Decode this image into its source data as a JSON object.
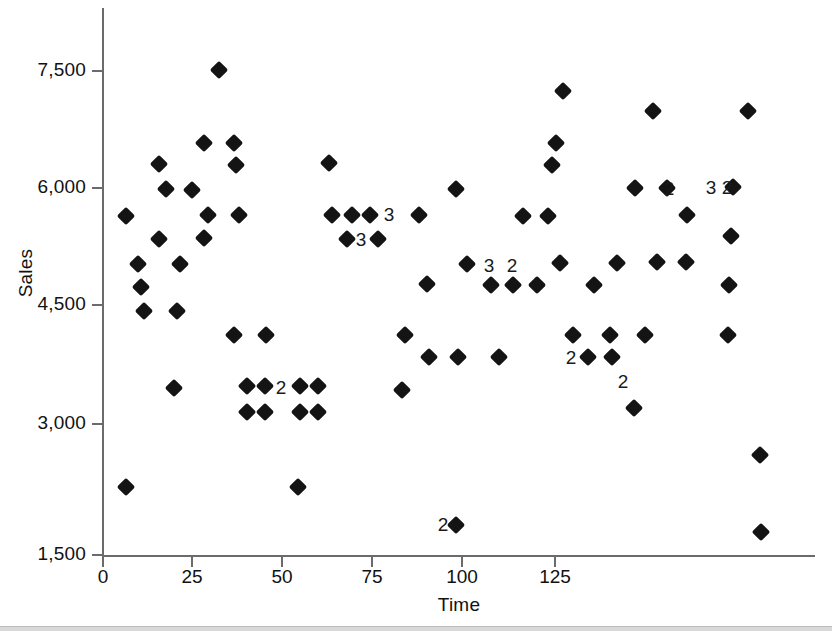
{
  "chart_data": {
    "type": "scatter",
    "title": "",
    "xlabel": "Time",
    "ylabel": "Sales",
    "xlim": [
      0,
      137
    ],
    "ylim": [
      1500,
      8050
    ],
    "grid": false,
    "legend": "none",
    "marker": "filled-diamond",
    "marker_color": "#141414",
    "axis_color": "#6b6b6b",
    "x_ticks": [
      0,
      25,
      50,
      75,
      100,
      125
    ],
    "x_tick_labels": [
      "0",
      "25",
      "50",
      "75",
      "100",
      "125"
    ],
    "y_ticks": [
      1500,
      3000,
      4500,
      6000,
      7500
    ],
    "y_tick_labels": [
      "1,500",
      "3,000",
      "4,500",
      "6,000",
      "7,500"
    ],
    "note": "Numeric labels beside markers indicate the number of coincident observations plotted at that location.",
    "points": [
      {
        "x": 4,
        "y": 5700,
        "n": 1
      },
      {
        "x": 4,
        "y": 2350,
        "n": 1
      },
      {
        "x": 8,
        "y": 5100,
        "n": 1
      },
      {
        "x": 8,
        "y": 4800,
        "n": 1
      },
      {
        "x": 8,
        "y": 4500,
        "n": 1
      },
      {
        "x": 10,
        "y": 6300,
        "n": 1
      },
      {
        "x": 12,
        "y": 6000,
        "n": 1
      },
      {
        "x": 12,
        "y": 5400,
        "n": 1
      },
      {
        "x": 14,
        "y": 4500,
        "n": 1
      },
      {
        "x": 14,
        "y": 3600,
        "n": 1
      },
      {
        "x": 16,
        "y": 5100,
        "n": 1
      },
      {
        "x": 20,
        "y": 6000,
        "n": 1
      },
      {
        "x": 20,
        "y": 5400,
        "n": 1
      },
      {
        "x": 21,
        "y": 6600,
        "n": 1
      },
      {
        "x": 22,
        "y": 5700,
        "n": 1
      },
      {
        "x": 23,
        "y": 7500,
        "n": 1
      },
      {
        "x": 25,
        "y": 6600,
        "n": 1
      },
      {
        "x": 25,
        "y": 6300,
        "n": 1
      },
      {
        "x": 26,
        "y": 4200,
        "n": 1
      },
      {
        "x": 27,
        "y": 5700,
        "n": 1
      },
      {
        "x": 29,
        "y": 3600,
        "n": 1
      },
      {
        "x": 29,
        "y": 3250,
        "n": 1
      },
      {
        "x": 33,
        "y": 3600,
        "n": 2
      },
      {
        "x": 33,
        "y": 3250,
        "n": 1
      },
      {
        "x": 33,
        "y": 4200,
        "n": 1
      },
      {
        "x": 39,
        "y": 2350,
        "n": 1
      },
      {
        "x": 41,
        "y": 3600,
        "n": 1
      },
      {
        "x": 41,
        "y": 3250,
        "n": 1
      },
      {
        "x": 44,
        "y": 3600,
        "n": 1
      },
      {
        "x": 44,
        "y": 3250,
        "n": 1
      },
      {
        "x": 44,
        "y": 6300,
        "n": 1
      },
      {
        "x": 47,
        "y": 5700,
        "n": 1
      },
      {
        "x": 49,
        "y": 5400,
        "n": 1
      },
      {
        "x": 51,
        "y": 5700,
        "n": 1
      },
      {
        "x": 53,
        "y": 5400,
        "n": 1
      },
      {
        "x": 55,
        "y": 5700,
        "n": 3
      },
      {
        "x": 53,
        "y": 5400,
        "n": 3
      },
      {
        "x": 61,
        "y": 5700,
        "n": 1
      },
      {
        "x": 61,
        "y": 4200,
        "n": 1
      },
      {
        "x": 61,
        "y": 3600,
        "n": 1
      },
      {
        "x": 63,
        "y": 4800,
        "n": 1
      },
      {
        "x": 64,
        "y": 3900,
        "n": 1
      },
      {
        "x": 68,
        "y": 1950,
        "n": 2
      },
      {
        "x": 71,
        "y": 6000,
        "n": 1
      },
      {
        "x": 71,
        "y": 3900,
        "n": 1
      },
      {
        "x": 74,
        "y": 5400,
        "n": 1
      },
      {
        "x": 75,
        "y": 5100,
        "n": 3
      },
      {
        "x": 78,
        "y": 4800,
        "n": 1
      },
      {
        "x": 79,
        "y": 3900,
        "n": 1
      },
      {
        "x": 80,
        "y": 5100,
        "n": 2
      },
      {
        "x": 82,
        "y": 4800,
        "n": 1
      },
      {
        "x": 86,
        "y": 5700,
        "n": 1
      },
      {
        "x": 88,
        "y": 4800,
        "n": 1
      },
      {
        "x": 89,
        "y": 5700,
        "n": 1
      },
      {
        "x": 89,
        "y": 6600,
        "n": 1
      },
      {
        "x": 89,
        "y": 6300,
        "n": 1
      },
      {
        "x": 93,
        "y": 7200,
        "n": 1
      },
      {
        "x": 94,
        "y": 5100,
        "n": 1
      },
      {
        "x": 95,
        "y": 4200,
        "n": 1
      },
      {
        "x": 95,
        "y": 3900,
        "n": 2
      },
      {
        "x": 98,
        "y": 4800,
        "n": 1
      },
      {
        "x": 99,
        "y": 4200,
        "n": 1
      },
      {
        "x": 101,
        "y": 3900,
        "n": 1
      },
      {
        "x": 101,
        "y": 4200,
        "n": 1
      },
      {
        "x": 101,
        "y": 5100,
        "n": 1
      },
      {
        "x": 103,
        "y": 3750,
        "n": 2
      },
      {
        "x": 106,
        "y": 4200,
        "n": 1
      },
      {
        "x": 107,
        "y": 3300,
        "n": 1
      },
      {
        "x": 110,
        "y": 6000,
        "n": 1
      },
      {
        "x": 110,
        "y": 6900,
        "n": 1
      },
      {
        "x": 111,
        "y": 5100,
        "n": 1
      },
      {
        "x": 113,
        "y": 6000,
        "n": 2
      },
      {
        "x": 117,
        "y": 5100,
        "n": 1
      },
      {
        "x": 117,
        "y": 5700,
        "n": 1
      },
      {
        "x": 122,
        "y": 6000,
        "n": 3
      },
      {
        "x": 124,
        "y": 6000,
        "n": 2
      },
      {
        "x": 125,
        "y": 5400,
        "n": 1
      },
      {
        "x": 125,
        "y": 4800,
        "n": 1
      },
      {
        "x": 125,
        "y": 4200,
        "n": 1
      },
      {
        "x": 126,
        "y": 6000,
        "n": 1
      },
      {
        "x": 126,
        "y": 6900,
        "n": 1
      },
      {
        "x": 131,
        "y": 2700,
        "n": 1
      },
      {
        "x": 131,
        "y": 2100,
        "n": 1
      }
    ],
    "rendered_markers": [
      {
        "px": 126,
        "py": 216
      },
      {
        "px": 126,
        "py": 487
      },
      {
        "px": 138,
        "py": 264
      },
      {
        "px": 141,
        "py": 287
      },
      {
        "px": 144,
        "py": 311
      },
      {
        "px": 159,
        "py": 164
      },
      {
        "px": 166,
        "py": 189
      },
      {
        "px": 159,
        "py": 239
      },
      {
        "px": 177,
        "py": 311
      },
      {
        "px": 174,
        "py": 388
      },
      {
        "px": 180,
        "py": 264
      },
      {
        "px": 192,
        "py": 190
      },
      {
        "px": 204,
        "py": 238
      },
      {
        "px": 204,
        "py": 143
      },
      {
        "px": 208,
        "py": 215
      },
      {
        "px": 219,
        "py": 70
      },
      {
        "px": 234,
        "py": 143
      },
      {
        "px": 236,
        "py": 165
      },
      {
        "px": 234,
        "py": 335
      },
      {
        "px": 239,
        "py": 215
      },
      {
        "px": 247,
        "py": 386
      },
      {
        "px": 247,
        "py": 412
      },
      {
        "px": 265,
        "py": 386
      },
      {
        "px": 265,
        "py": 412
      },
      {
        "px": 266,
        "py": 335
      },
      {
        "px": 300,
        "py": 386
      },
      {
        "px": 300,
        "py": 412
      },
      {
        "px": 298,
        "py": 487
      },
      {
        "px": 318,
        "py": 386
      },
      {
        "px": 318,
        "py": 412
      },
      {
        "px": 329,
        "py": 163
      },
      {
        "px": 332,
        "py": 215
      },
      {
        "px": 347,
        "py": 239
      },
      {
        "px": 352,
        "py": 215
      },
      {
        "px": 370,
        "py": 215
      },
      {
        "px": 378,
        "py": 239
      },
      {
        "px": 405,
        "py": 335
      },
      {
        "px": 402,
        "py": 390
      },
      {
        "px": 419,
        "py": 215
      },
      {
        "px": 427,
        "py": 284
      },
      {
        "px": 429,
        "py": 357
      },
      {
        "px": 456,
        "py": 525
      },
      {
        "px": 456,
        "py": 189
      },
      {
        "px": 458,
        "py": 357
      },
      {
        "px": 467,
        "py": 264
      },
      {
        "px": 491,
        "py": 285
      },
      {
        "px": 499,
        "py": 357
      },
      {
        "px": 513,
        "py": 285
      },
      {
        "px": 537,
        "py": 285
      },
      {
        "px": 523,
        "py": 216
      },
      {
        "px": 548,
        "py": 216
      },
      {
        "px": 552,
        "py": 165
      },
      {
        "px": 556,
        "py": 143
      },
      {
        "px": 563,
        "py": 91
      },
      {
        "px": 560,
        "py": 263
      },
      {
        "px": 573,
        "py": 335
      },
      {
        "px": 588,
        "py": 357
      },
      {
        "px": 610,
        "py": 335
      },
      {
        "px": 612,
        "py": 357
      },
      {
        "px": 594,
        "py": 285
      },
      {
        "px": 617,
        "py": 263
      },
      {
        "px": 645,
        "py": 335
      },
      {
        "px": 634,
        "py": 408
      },
      {
        "px": 635,
        "py": 188
      },
      {
        "px": 653,
        "py": 111
      },
      {
        "px": 657,
        "py": 262
      },
      {
        "px": 667,
        "py": 188
      },
      {
        "px": 686,
        "py": 262
      },
      {
        "px": 687,
        "py": 215
      },
      {
        "px": 733,
        "py": 187
      },
      {
        "px": 731,
        "py": 236
      },
      {
        "px": 729,
        "py": 285
      },
      {
        "px": 728,
        "py": 335
      },
      {
        "px": 748,
        "py": 111
      },
      {
        "px": 760,
        "py": 455
      },
      {
        "px": 761,
        "py": 532
      }
    ],
    "count_annotations": [
      {
        "label": "2",
        "px": 281,
        "py": 387
      },
      {
        "label": "3",
        "px": 389,
        "py": 214
      },
      {
        "label": "3",
        "px": 361,
        "py": 239
      },
      {
        "label": "3",
        "px": 489,
        "py": 265
      },
      {
        "label": "2",
        "px": 512,
        "py": 265
      },
      {
        "label": "2",
        "px": 443,
        "py": 524
      },
      {
        "label": "2",
        "px": 571,
        "py": 357
      },
      {
        "label": "2",
        "px": 623,
        "py": 381
      },
      {
        "label": "2",
        "px": 669,
        "py": 188
      },
      {
        "label": "3",
        "px": 711,
        "py": 187
      },
      {
        "label": "2",
        "px": 727,
        "py": 187
      }
    ]
  },
  "axis": {
    "y_title": "Sales",
    "x_title": "Time"
  }
}
